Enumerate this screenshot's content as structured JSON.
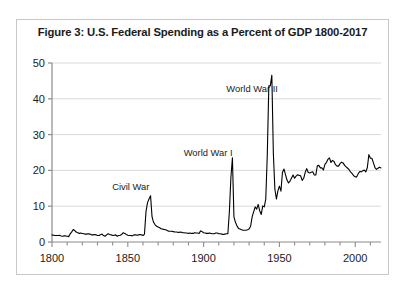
{
  "figure": {
    "title": "Figure 3: U.S. Federal Spending as a Percent of GDP 1800-2017",
    "border_color": "#c8c8c8",
    "background": "#ffffff"
  },
  "chart_data": {
    "type": "line",
    "title": "Figure 3: U.S. Federal Spending as a Percent of GDP 1800-2017",
    "xlabel": "",
    "ylabel": "",
    "xlim": [
      1800,
      2017
    ],
    "ylim": [
      0,
      50
    ],
    "grid": "horizontal",
    "legend": "none",
    "line_color": "#000000",
    "line_width": 1.1,
    "axis_color": "#8c8c8c",
    "gridline_color": "#d9d9d9",
    "y_ticks": [
      0,
      10,
      20,
      30,
      40,
      50
    ],
    "y_tick_labels": [
      "0",
      "10",
      "20",
      "30",
      "40",
      "50"
    ],
    "x_ticks_major": [
      1800,
      1850,
      1900,
      1950,
      2000
    ],
    "x_tick_labels": [
      "1800",
      "1850",
      "1900",
      "1950",
      "2000"
    ],
    "x_ticks_minor_step": 10,
    "annotations": [
      {
        "text": "Civil War",
        "x": 1852,
        "y": 14.5
      },
      {
        "text": "World War I",
        "x": 1903,
        "y": 24.0
      },
      {
        "text": "World War II",
        "x": 1932,
        "y": 42.0
      }
    ],
    "series": [
      {
        "name": "Federal spending (% of GDP)",
        "x": [
          1800,
          1801,
          1802,
          1803,
          1804,
          1805,
          1806,
          1807,
          1808,
          1809,
          1810,
          1811,
          1812,
          1813,
          1814,
          1815,
          1816,
          1817,
          1818,
          1819,
          1820,
          1821,
          1822,
          1823,
          1824,
          1825,
          1826,
          1827,
          1828,
          1829,
          1830,
          1831,
          1832,
          1833,
          1834,
          1835,
          1836,
          1837,
          1838,
          1839,
          1840,
          1841,
          1842,
          1843,
          1844,
          1845,
          1846,
          1847,
          1848,
          1849,
          1850,
          1851,
          1852,
          1853,
          1854,
          1855,
          1856,
          1857,
          1858,
          1859,
          1860,
          1861,
          1862,
          1863,
          1864,
          1865,
          1866,
          1867,
          1868,
          1869,
          1870,
          1871,
          1872,
          1873,
          1874,
          1875,
          1876,
          1877,
          1878,
          1879,
          1880,
          1881,
          1882,
          1883,
          1884,
          1885,
          1886,
          1887,
          1888,
          1889,
          1890,
          1891,
          1892,
          1893,
          1894,
          1895,
          1896,
          1897,
          1898,
          1899,
          1900,
          1901,
          1902,
          1903,
          1904,
          1905,
          1906,
          1907,
          1908,
          1909,
          1910,
          1911,
          1912,
          1913,
          1914,
          1915,
          1916,
          1917,
          1918,
          1919,
          1920,
          1921,
          1922,
          1923,
          1924,
          1925,
          1926,
          1927,
          1928,
          1929,
          1930,
          1931,
          1932,
          1933,
          1934,
          1935,
          1936,
          1937,
          1938,
          1939,
          1940,
          1941,
          1942,
          1943,
          1944,
          1945,
          1946,
          1947,
          1948,
          1949,
          1950,
          1951,
          1952,
          1953,
          1954,
          1955,
          1956,
          1957,
          1958,
          1959,
          1960,
          1961,
          1962,
          1963,
          1964,
          1965,
          1966,
          1967,
          1968,
          1969,
          1970,
          1971,
          1972,
          1973,
          1974,
          1975,
          1976,
          1977,
          1978,
          1979,
          1980,
          1981,
          1982,
          1983,
          1984,
          1985,
          1986,
          1987,
          1988,
          1989,
          1990,
          1991,
          1992,
          1993,
          1994,
          1995,
          1996,
          1997,
          1998,
          1999,
          2000,
          2001,
          2002,
          2003,
          2004,
          2005,
          2006,
          2007,
          2008,
          2009,
          2010,
          2011,
          2012,
          2013,
          2014,
          2015,
          2016,
          2017
        ],
        "values": [
          2.0,
          1.9,
          1.8,
          1.8,
          1.8,
          1.9,
          1.7,
          1.6,
          1.7,
          1.7,
          1.6,
          1.5,
          2.3,
          2.8,
          3.5,
          3.2,
          2.8,
          2.6,
          2.4,
          2.5,
          2.4,
          2.3,
          2.2,
          2.2,
          2.3,
          2.2,
          2.0,
          2.0,
          2.1,
          2.0,
          1.8,
          1.8,
          2.0,
          2.2,
          1.8,
          1.6,
          2.0,
          2.3,
          2.1,
          2.0,
          1.8,
          1.9,
          2.0,
          1.6,
          1.8,
          1.9,
          2.1,
          2.6,
          2.4,
          2.1,
          1.9,
          1.8,
          1.8,
          1.7,
          2.0,
          2.0,
          1.9,
          2.0,
          2.1,
          2.0,
          1.8,
          2.2,
          8.5,
          11.0,
          12.0,
          12.9,
          7.0,
          5.5,
          4.8,
          4.4,
          4.2,
          4.0,
          3.7,
          3.6,
          3.5,
          3.4,
          3.2,
          3.0,
          3.0,
          3.0,
          2.9,
          2.8,
          2.8,
          2.7,
          2.7,
          2.8,
          2.6,
          2.6,
          2.5,
          2.5,
          2.4,
          2.5,
          2.4,
          2.4,
          2.6,
          2.5,
          2.5,
          2.4,
          3.1,
          2.9,
          2.6,
          2.5,
          2.4,
          2.4,
          2.5,
          2.4,
          2.3,
          2.3,
          2.5,
          2.5,
          2.3,
          2.3,
          2.2,
          2.1,
          2.2,
          2.3,
          2.3,
          8.5,
          18.0,
          23.5,
          7.0,
          5.5,
          4.5,
          3.8,
          3.6,
          3.4,
          3.3,
          3.3,
          3.3,
          3.4,
          3.6,
          4.4,
          7.0,
          8.4,
          9.8,
          9.2,
          10.5,
          8.7,
          7.7,
          10.1,
          9.8,
          12.0,
          24.3,
          43.6,
          43.6,
          46.6,
          24.8,
          14.8,
          12.0,
          14.3,
          15.6,
          14.2,
          19.4,
          20.4,
          18.8,
          17.3,
          16.5,
          17.0,
          17.9,
          18.7,
          17.8,
          18.4,
          18.8,
          18.6,
          18.5,
          17.2,
          17.8,
          19.4,
          20.5,
          19.4,
          19.3,
          19.5,
          19.6,
          18.7,
          18.7,
          21.3,
          21.4,
          20.7,
          20.7,
          20.1,
          21.7,
          22.2,
          23.1,
          23.5,
          22.2,
          22.8,
          22.5,
          21.6,
          21.2,
          21.2,
          21.9,
          22.3,
          22.1,
          21.4,
          21.0,
          20.6,
          20.2,
          19.5,
          19.1,
          18.5,
          18.2,
          18.2,
          19.1,
          19.7,
          19.6,
          19.9,
          20.1,
          19.6,
          20.8,
          24.4,
          23.4,
          23.4,
          22.1,
          20.8,
          20.3,
          20.6,
          20.9,
          20.7
        ]
      }
    ]
  }
}
